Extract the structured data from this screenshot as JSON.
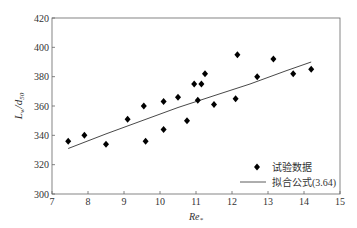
{
  "chart_data": {
    "type": "scatter",
    "title": "",
    "xlabel": "Re*",
    "ylabel": "Lw/d50",
    "xlim": [
      7,
      15
    ],
    "ylim": [
      300,
      420
    ],
    "xticks": [
      7,
      8,
      9,
      10,
      11,
      12,
      13,
      14,
      15
    ],
    "yticks": [
      300,
      320,
      340,
      360,
      380,
      400,
      420
    ],
    "grid": false,
    "legend_position": "lower right",
    "series": [
      {
        "name": "试验数据",
        "type": "scatter",
        "marker": "diamond",
        "x": [
          7.45,
          7.9,
          8.5,
          9.1,
          9.55,
          9.6,
          10.1,
          10.1,
          10.5,
          10.75,
          10.95,
          11.05,
          11.15,
          11.25,
          11.5,
          12.1,
          12.15,
          12.7,
          13.15,
          13.7,
          14.2
        ],
        "y": [
          336,
          340,
          334,
          351,
          360,
          336,
          363,
          344,
          366,
          350,
          375,
          364,
          375,
          382,
          361,
          365,
          395,
          380,
          392,
          382,
          385
        ]
      },
      {
        "name": "拟合公式(3.64)",
        "type": "line",
        "x": [
          7.45,
          8.5,
          9.5,
          10.5,
          11.5,
          12.5,
          13.5,
          14.2
        ],
        "y": [
          331,
          341,
          350,
          359,
          367,
          375,
          384,
          390
        ]
      }
    ]
  },
  "labels": {
    "ylabel_main": "L",
    "ylabel_sub1": "w",
    "ylabel_mid": "/d",
    "ylabel_sub2": "50",
    "xlabel_main": "Re",
    "xlabel_sub": "*",
    "legend_points": "试验数据",
    "legend_line": "拟合公式(3.64)"
  }
}
